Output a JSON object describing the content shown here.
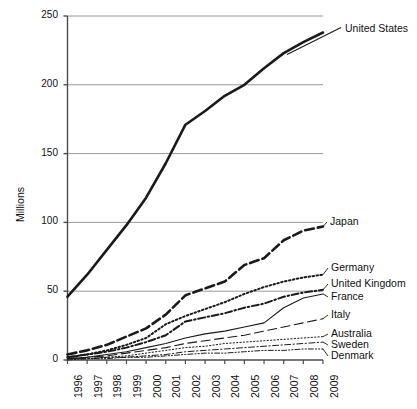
{
  "chart_data": {
    "type": "line",
    "title": "",
    "xlabel": "",
    "ylabel": "Millions",
    "ylim": [
      0,
      250
    ],
    "yticks": [
      0,
      50,
      100,
      150,
      200,
      250
    ],
    "grid": true,
    "legend_position": "right-endpoint-labels",
    "categories": [
      "1996",
      "1997",
      "1998",
      "1999",
      "2000",
      "2001",
      "2002",
      "2003",
      "2004",
      "2005",
      "2006",
      "2007",
      "2008",
      "2009"
    ],
    "series": [
      {
        "name": "United States",
        "style": "thick-solid",
        "values": [
          46,
          62,
          80,
          98,
          118,
          143,
          171,
          181,
          192,
          200,
          212,
          223,
          231,
          238
        ]
      },
      {
        "name": "Japan",
        "style": "thick-dashed",
        "values": [
          4,
          7,
          11,
          17,
          23,
          33,
          47,
          52,
          57,
          69,
          74,
          87,
          94,
          97
        ]
      },
      {
        "name": "Germany",
        "style": "dotted",
        "values": [
          2,
          4,
          7,
          11,
          16,
          26,
          32,
          37,
          42,
          48,
          53,
          57,
          60,
          62
        ]
      },
      {
        "name": "United Kingdom",
        "style": "dash-dot",
        "values": [
          2,
          4,
          6,
          9,
          13,
          18,
          28,
          31,
          34,
          38,
          41,
          46,
          49,
          51
        ]
      },
      {
        "name": "France",
        "style": "thin-solid",
        "values": [
          1,
          2,
          4,
          6,
          9,
          12,
          16,
          19,
          21,
          24,
          27,
          38,
          45,
          48
        ]
      },
      {
        "name": "Italy",
        "style": "long-dash",
        "values": [
          1,
          2,
          3,
          5,
          7,
          9,
          12,
          14,
          16,
          18,
          21,
          24,
          27,
          30
        ]
      },
      {
        "name": "Australia",
        "style": "fine-dotted",
        "values": [
          1,
          1,
          2,
          3,
          5,
          7,
          9,
          10,
          12,
          13,
          14,
          15,
          16,
          17
        ]
      },
      {
        "name": "Sweden",
        "style": "thin-dash-dot",
        "values": [
          1,
          1,
          2,
          2,
          3,
          4,
          6,
          7,
          8,
          9,
          10,
          11,
          12,
          13
        ]
      },
      {
        "name": "Denmark",
        "style": "thin-dash-dot-dot",
        "values": [
          0,
          1,
          1,
          2,
          2,
          3,
          4,
          5,
          5,
          6,
          7,
          7,
          8,
          8
        ]
      }
    ],
    "label_anchors": [
      {
        "name": "United States",
        "x": 345,
        "y": 33
      },
      {
        "name": "Japan",
        "x": 330,
        "y": 226
      },
      {
        "name": "Germany",
        "x": 331,
        "y": 272
      },
      {
        "name": "United Kingdom",
        "x": 331,
        "y": 288
      },
      {
        "name": "France",
        "x": 331,
        "y": 301
      },
      {
        "name": "Italy",
        "x": 331,
        "y": 319
      },
      {
        "name": "Australia",
        "x": 331,
        "y": 338
      },
      {
        "name": "Sweden",
        "x": 331,
        "y": 349
      },
      {
        "name": "Denmark",
        "x": 331,
        "y": 360
      }
    ],
    "colors": {
      "line": "#1a1a1a",
      "grid": "#9a9a9a",
      "axis": "#4d4d4d",
      "background": "#ffffff"
    }
  }
}
